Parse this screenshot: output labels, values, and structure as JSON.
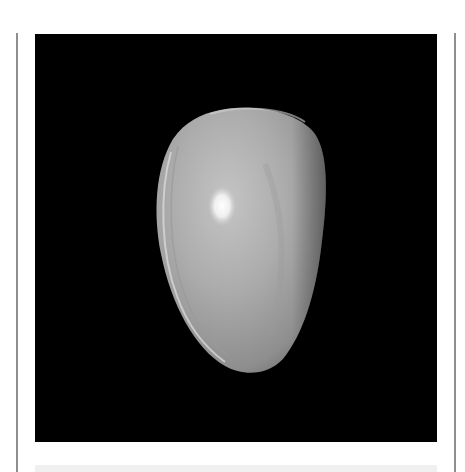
{
  "photo": {
    "subject": "cowrie shell",
    "background_color": "#000000",
    "shell_color": "#a9a9a9",
    "highlight_color": "#ffffff"
  },
  "frame": {
    "border_color": "#8f8f8f",
    "caption_strip_color": "#f0f0f0"
  }
}
